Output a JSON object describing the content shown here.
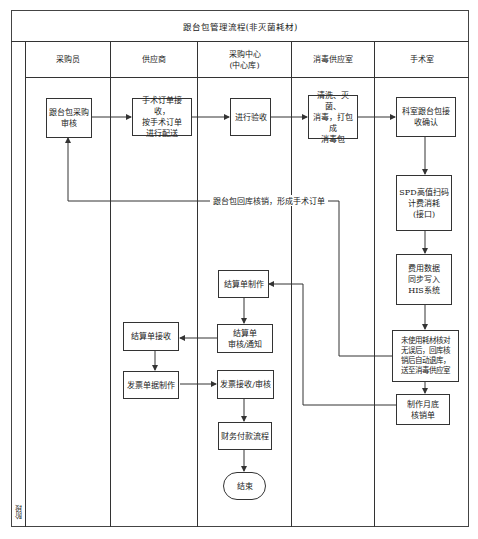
{
  "title": "跟台包管理流程(非灭菌耗材)",
  "stage_label": "阶段",
  "lanes": [
    {
      "id": "buyer",
      "label": "采购员"
    },
    {
      "id": "supplier",
      "label": "供应商"
    },
    {
      "id": "center",
      "label": "采购中心\n(中心库)"
    },
    {
      "id": "sterile",
      "label": "消毒供应室"
    },
    {
      "id": "or",
      "label": "手术室"
    }
  ],
  "nodes": {
    "buyer_review": "跟台包采购\n审核",
    "supplier_receive": "手术订单接收，\n按手术订单\n进行配送",
    "center_accept": "进行验收",
    "sterile_process": "清洗、灭菌、\n消毒，打包成\n消毒包",
    "or_confirm": "科室跟台包接\n收确认",
    "or_spd": "SPD高值扫码\n计费消耗\n(接口)",
    "or_his": "费用数据\n同步写入\nHIS系统",
    "or_unused": "未使用耗材核对\n无误后，回库核\n销后自动退库，\n送至消毒供应室",
    "or_monthly": "制作月底\n核销单",
    "center_settle_make": "结算单制作",
    "center_settle_review": "结算单\n审核/通知",
    "supplier_settle_receive": "结算单接收",
    "supplier_invoice_make": "发票单据制作",
    "center_invoice_review": "发票接收/审核",
    "center_finance": "财务付款流程",
    "end": "结束"
  },
  "edge_labels": {
    "return_loop": "跟台包回库核销，形成手术订单"
  },
  "colors": {
    "line": "#333333",
    "background": "#ffffff"
  }
}
